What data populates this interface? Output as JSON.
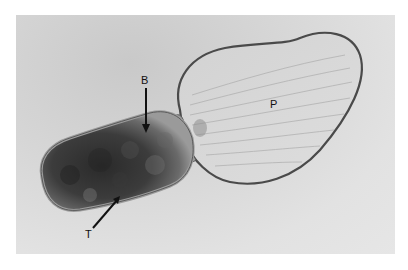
{
  "figure": {
    "labels": {
      "b": "B",
      "t": "T",
      "p": "P"
    },
    "colors": {
      "background": "#e2e2e2",
      "dark_body": "#3a3a3a",
      "lobe_fill": "#d9d9d9",
      "outline": "#555555",
      "label_text": "#111111"
    }
  }
}
